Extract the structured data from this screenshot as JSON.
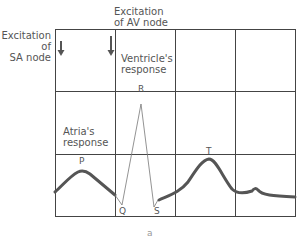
{
  "diagram": {
    "labels": {
      "sa_node_line1": "Excitation",
      "sa_node_line2": "of",
      "sa_node_line3": "SA node",
      "av_node_line1": "Excitation",
      "av_node_line2": "of AV node",
      "ventricle_line1": "Ventricle's",
      "ventricle_line2": "response",
      "atria_line1": "Atria's",
      "atria_line2": "response",
      "wave_p": "P",
      "wave_q": "Q",
      "wave_r": "R",
      "wave_s": "S",
      "wave_t": "T",
      "figure_label": "a"
    },
    "grid": {
      "columns": 4,
      "rows": 3,
      "line_color": "#444444"
    },
    "trace": {
      "color": "#555555",
      "thin_color": "#777777"
    },
    "arrows": [
      "sa-node-arrow",
      "av-node-arrow"
    ]
  }
}
